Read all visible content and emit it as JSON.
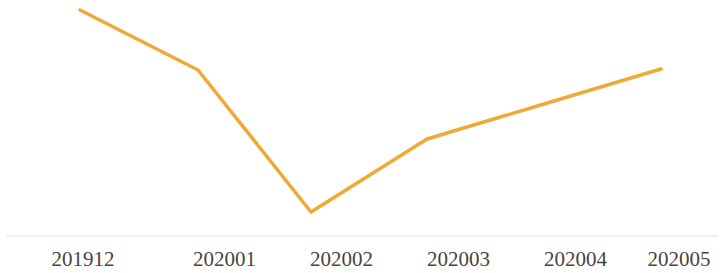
{
  "chart_data": {
    "type": "line",
    "title": "",
    "subtitle": "",
    "xlabel": "",
    "ylabel": "",
    "grid": false,
    "legend": false,
    "legend_position": "none",
    "axis_visible": {
      "x": true,
      "y": false
    },
    "categories": [
      "201912",
      "202001",
      "202002",
      "202003",
      "202004",
      "202005"
    ],
    "series": [
      {
        "name": "series-1",
        "color": "#f0a935",
        "line_width": 3.5,
        "markers": false,
        "values": [
          97,
          72,
          13,
          43,
          58,
          73
        ]
      }
    ],
    "ylim": [
      0,
      105
    ],
    "xtick_labels": [
      "201912",
      "202001",
      "202002",
      "202003",
      "202004",
      "202005"
    ],
    "pixel_points": [
      {
        "x": 80,
        "y": 10
      },
      {
        "x": 198,
        "y": 70
      },
      {
        "x": 311,
        "y": 212
      },
      {
        "x": 427,
        "y": 139
      },
      {
        "x": 544,
        "y": 104
      },
      {
        "x": 661,
        "y": 69
      }
    ],
    "polyline_points": "80,10 198,70 311,212 427,139 544,104 661,69"
  },
  "axis": {
    "x_axis_line_color": "#f2f0ee",
    "x_axis_line_y": 236,
    "x_axis_line_x1": 6,
    "x_axis_line_x2": 718
  },
  "colors": {
    "background": "#ffffff",
    "series_orange": "#f0a935",
    "label_text": "#4a4440",
    "axis_line": "#f2f0ee"
  },
  "labels": {
    "tick_0": "201912",
    "tick_1": "202001",
    "tick_2": "202002",
    "tick_3": "202003",
    "tick_4": "202004",
    "tick_5": "202005"
  }
}
